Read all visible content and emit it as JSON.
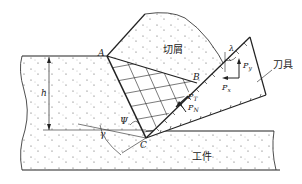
{
  "diagram": {
    "points": {
      "A": "A",
      "B": "B",
      "C": "C"
    },
    "labels": {
      "chip": "切屑",
      "tool": "刀具",
      "workpiece": "工件",
      "depth": "h",
      "shear_angle": "Ψ",
      "rake_angle": "γ",
      "lambda": "λ",
      "force_y": "P",
      "force_y_sub": "y",
      "force_x": "P",
      "force_x_sub": "x",
      "force_t": "P",
      "force_t_sub": "T",
      "force_n": "P",
      "force_n_sub": "N"
    },
    "colors": {
      "stroke": "#222222",
      "background": "#ffffff",
      "dots": "#555555"
    }
  }
}
